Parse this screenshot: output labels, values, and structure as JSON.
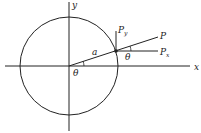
{
  "diagram": {
    "labels": {
      "x_axis": "x",
      "y_axis": "y",
      "radius": "a",
      "point": "P",
      "px": "P",
      "px_sub": "x",
      "py": "P",
      "py_sub": "y",
      "theta_center": "θ",
      "theta_point": "θ"
    },
    "colors": {
      "stroke": "#222222",
      "background": "#ffffff"
    }
  }
}
